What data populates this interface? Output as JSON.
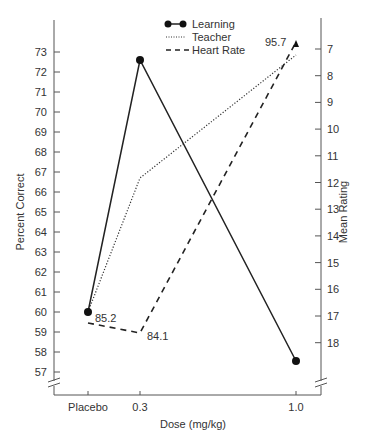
{
  "chart_data": {
    "type": "line",
    "title": "",
    "xlabel": "Dose (mg/kg)",
    "ylabel": "Percent Correct",
    "y2label": "Mean Rating",
    "x": [
      "Placebo",
      "0.3",
      "1.0"
    ],
    "left_axis": {
      "ticks": [
        57,
        58,
        59,
        60,
        61,
        62,
        63,
        64,
        65,
        66,
        67,
        68,
        69,
        70,
        71,
        72,
        73
      ],
      "axis_break": true
    },
    "right_axis": {
      "ticks": [
        7,
        8,
        9,
        10,
        11,
        12,
        13,
        14,
        15,
        16,
        17,
        18
      ],
      "inverted": true,
      "axis_break": true
    },
    "series": [
      {
        "name": "Learning",
        "style": "solid-with-circles",
        "axis": "left",
        "values": [
          60.0,
          72.6,
          57.6
        ]
      },
      {
        "name": "Teacher",
        "style": "dotted",
        "axis": "right",
        "values": [
          16.9,
          12.0,
          7.2
        ]
      },
      {
        "name": "Heart Rate",
        "style": "dashed",
        "axis": "right",
        "values": [
          17.3,
          17.7,
          6.7
        ],
        "labels": [
          "85.2",
          "84.1",
          "95.7"
        ],
        "end_marker": "triangle"
      }
    ],
    "legend": [
      "Learning",
      "Teacher",
      "Heart Rate"
    ],
    "legend_position": "top-center",
    "grid": false
  },
  "labels": {
    "x_title": "Dose (mg/kg)",
    "y_left_title": "Percent Correct",
    "y_right_title": "Mean Rating",
    "x_ticks": [
      "Placebo",
      "0.3",
      "1.0"
    ],
    "legend": {
      "learning": "Learning",
      "teacher": "Teacher",
      "heart_rate": "Heart Rate"
    },
    "annotations": {
      "hr_placebo": "85.2",
      "hr_03": "84.1",
      "hr_10": "95.7"
    },
    "left_ticks": [
      "73",
      "72",
      "71",
      "70",
      "69",
      "68",
      "67",
      "66",
      "65",
      "64",
      "63",
      "62",
      "61",
      "60",
      "59",
      "58",
      "57"
    ],
    "right_ticks": [
      "7",
      "8",
      "9",
      "10",
      "11",
      "12",
      "13",
      "14",
      "15",
      "16",
      "17",
      "18"
    ]
  },
  "colors": {
    "ink": "#2a2a2a",
    "background": "#ffffff"
  }
}
